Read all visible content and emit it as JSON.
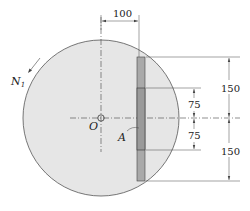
{
  "figure": {
    "labels": {
      "rotation": "N",
      "rotation_sub": "1",
      "center": "O",
      "plate": "A"
    },
    "dimensions": {
      "offset": "100",
      "upper_outer": "150",
      "lower_outer": "150",
      "upper_inner": "75",
      "lower_inner": "75"
    },
    "colors": {
      "disk_fill": "#e6e6e6",
      "bar_fill": "#a9a9a9",
      "line": "#333333"
    }
  }
}
